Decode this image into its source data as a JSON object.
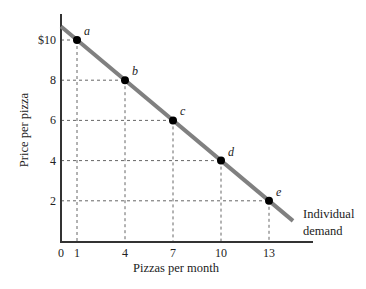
{
  "chart_data": {
    "type": "line",
    "title": "",
    "xlabel": "Pizzas per month",
    "ylabel": "Price per pizza",
    "xlim": [
      0,
      15.5
    ],
    "ylim": [
      0,
      11.2
    ],
    "x_ticks": [
      0,
      1,
      4,
      7,
      10,
      13
    ],
    "x_tick_labels": [
      "0",
      "1",
      "4",
      "7",
      "10",
      "13"
    ],
    "y_ticks": [
      2,
      4,
      6,
      8,
      10
    ],
    "y_tick_labels": [
      "2",
      "4",
      "6",
      "8",
      "$10"
    ],
    "grid": false,
    "guide_lines": "dashed from each point to both axes",
    "series": [
      {
        "name": "Individual demand",
        "line_color": "#808080",
        "line_from": [
          0,
          10.67
        ],
        "line_to": [
          14.5,
          1.0
        ],
        "points": [
          {
            "label": "a",
            "x": 1,
            "y": 10
          },
          {
            "label": "b",
            "x": 4,
            "y": 8
          },
          {
            "label": "c",
            "x": 7,
            "y": 6
          },
          {
            "label": "d",
            "x": 10,
            "y": 4
          },
          {
            "label": "e",
            "x": 13,
            "y": 2
          }
        ]
      }
    ],
    "annotations": [
      {
        "text": "Individual",
        "position": "end of line, right"
      },
      {
        "text": "demand",
        "position": "end of line, right"
      }
    ],
    "legend": null
  },
  "labels": {
    "xlabel": "Pizzas per month",
    "ylabel": "Price per pizza",
    "curve_line1": "Individual",
    "curve_line2": "demand"
  }
}
